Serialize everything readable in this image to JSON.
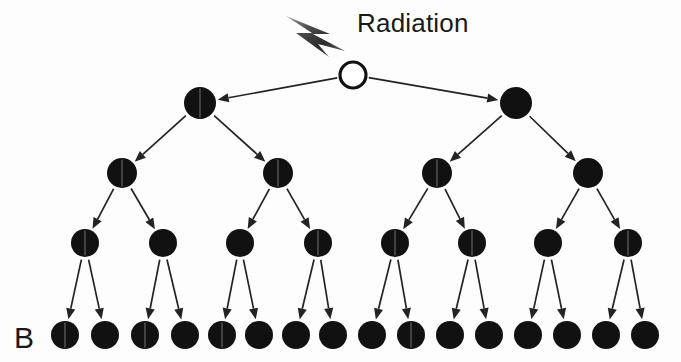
{
  "figure": {
    "panel_label": "B",
    "radiation_label": "Radiation",
    "radiation_icon": "lightning-bolt-icon",
    "colors": {
      "cell_fill": "#111111",
      "cell_outline": "#111111",
      "edge": "#232323",
      "background": "#fdfdfd",
      "bolt_dark": "#2f2f2f",
      "bolt_light": "#8d8d8d"
    }
  },
  "diagram": {
    "type": "binary-division-tree",
    "levels": [
      {
        "index": 0,
        "name": "irradiated-parent-cell",
        "count": 1,
        "y": 75,
        "radius": 13,
        "style": "hollow",
        "nodes": [
          {
            "id": "n0",
            "x": 353,
            "split": false
          }
        ]
      },
      {
        "index": 1,
        "name": "first-division",
        "count": 2,
        "y": 103,
        "radius": 16,
        "style": "filled",
        "nodes": [
          {
            "id": "n1",
            "x": 200,
            "split": true
          },
          {
            "id": "n2",
            "x": 516,
            "split": false
          }
        ]
      },
      {
        "index": 2,
        "name": "second-division",
        "count": 4,
        "y": 173,
        "radius": 15,
        "style": "filled",
        "nodes": [
          {
            "id": "n3",
            "x": 122,
            "split": true
          },
          {
            "id": "n4",
            "x": 278,
            "split": true
          },
          {
            "id": "n5",
            "x": 437,
            "split": true
          },
          {
            "id": "n6",
            "x": 588,
            "split": false
          }
        ]
      },
      {
        "index": 3,
        "name": "third-division",
        "count": 8,
        "y": 243,
        "radius": 14,
        "style": "filled",
        "nodes": [
          {
            "id": "n7",
            "x": 85,
            "split": true
          },
          {
            "id": "n8",
            "x": 163,
            "split": false
          },
          {
            "id": "n9",
            "x": 240,
            "split": false
          },
          {
            "id": "n10",
            "x": 318,
            "split": true
          },
          {
            "id": "n11",
            "x": 395,
            "split": true
          },
          {
            "id": "n12",
            "x": 472,
            "split": true
          },
          {
            "id": "n13",
            "x": 548,
            "split": false
          },
          {
            "id": "n14",
            "x": 628,
            "split": true
          }
        ]
      },
      {
        "index": 4,
        "name": "fourth-division",
        "count": 16,
        "y": 335,
        "radius": 14,
        "style": "filled",
        "nodes": [
          {
            "id": "n15",
            "x": 65,
            "split": true
          },
          {
            "id": "n16",
            "x": 105,
            "split": false
          },
          {
            "id": "n17",
            "x": 145,
            "split": true
          },
          {
            "id": "n18",
            "x": 185,
            "split": false
          },
          {
            "id": "n19",
            "x": 222,
            "split": true
          },
          {
            "id": "n20",
            "x": 259,
            "split": false
          },
          {
            "id": "n21",
            "x": 296,
            "split": false
          },
          {
            "id": "n22",
            "x": 333,
            "split": false
          },
          {
            "id": "n23",
            "x": 372,
            "split": false
          },
          {
            "id": "n24",
            "x": 411,
            "split": true
          },
          {
            "id": "n25",
            "x": 450,
            "split": false
          },
          {
            "id": "n26",
            "x": 489,
            "split": false
          },
          {
            "id": "n27",
            "x": 528,
            "split": false
          },
          {
            "id": "n28",
            "x": 567,
            "split": false
          },
          {
            "id": "n29",
            "x": 606,
            "split": false
          },
          {
            "id": "n30",
            "x": 645,
            "split": false
          }
        ]
      }
    ],
    "edges": [
      {
        "from": "n0",
        "to": "n1"
      },
      {
        "from": "n0",
        "to": "n2"
      },
      {
        "from": "n1",
        "to": "n3"
      },
      {
        "from": "n1",
        "to": "n4"
      },
      {
        "from": "n2",
        "to": "n5"
      },
      {
        "from": "n2",
        "to": "n6"
      },
      {
        "from": "n3",
        "to": "n7"
      },
      {
        "from": "n3",
        "to": "n8"
      },
      {
        "from": "n4",
        "to": "n9"
      },
      {
        "from": "n4",
        "to": "n10"
      },
      {
        "from": "n5",
        "to": "n11"
      },
      {
        "from": "n5",
        "to": "n12"
      },
      {
        "from": "n6",
        "to": "n13"
      },
      {
        "from": "n6",
        "to": "n14"
      },
      {
        "from": "n7",
        "to": "n15"
      },
      {
        "from": "n7",
        "to": "n16"
      },
      {
        "from": "n8",
        "to": "n17"
      },
      {
        "from": "n8",
        "to": "n18"
      },
      {
        "from": "n9",
        "to": "n19"
      },
      {
        "from": "n9",
        "to": "n20"
      },
      {
        "from": "n10",
        "to": "n21"
      },
      {
        "from": "n10",
        "to": "n22"
      },
      {
        "from": "n11",
        "to": "n23"
      },
      {
        "from": "n11",
        "to": "n24"
      },
      {
        "from": "n12",
        "to": "n25"
      },
      {
        "from": "n12",
        "to": "n26"
      },
      {
        "from": "n13",
        "to": "n27"
      },
      {
        "from": "n13",
        "to": "n28"
      },
      {
        "from": "n14",
        "to": "n29"
      },
      {
        "from": "n14",
        "to": "n30"
      }
    ],
    "radiation_source": {
      "name": "radiation-bolt",
      "x": 286,
      "y": 12,
      "width": 62,
      "height": 40,
      "label_x": 357,
      "label_y": 32
    },
    "panel_label_pos": {
      "x": 14,
      "y": 348
    }
  }
}
